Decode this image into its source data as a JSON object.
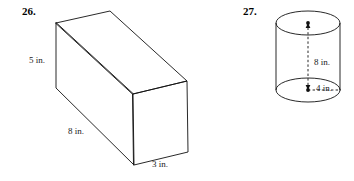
{
  "page": {
    "background_color": "#ffffff",
    "ink_color": "#000000",
    "width": 354,
    "height": 181
  },
  "problems": [
    {
      "number": "26.",
      "shape": "rectangular-prism",
      "labels": [
        {
          "name": "height",
          "text": "5 in.",
          "value": 5,
          "unit": "in."
        },
        {
          "name": "length",
          "text": "8 in.",
          "value": 8,
          "unit": "in."
        },
        {
          "name": "depth",
          "text": "3  in.",
          "value": 3,
          "unit": "in."
        }
      ]
    },
    {
      "number": "27.",
      "shape": "cylinder",
      "labels": [
        {
          "name": "height",
          "text": "8 in.",
          "value": 8,
          "unit": "in."
        },
        {
          "name": "radius",
          "text": "4 in.",
          "value": 4,
          "unit": "in."
        }
      ]
    }
  ],
  "geometry": {
    "prism": {
      "front_top_left": [
        56,
        23
      ],
      "front_bottom_left": [
        56,
        88
      ],
      "top_back_left": [
        110,
        11
      ],
      "top_back_right": [
        187,
        81
      ],
      "front_top_right": [
        133,
        94
      ],
      "front_bottom_right": [
        134,
        165
      ],
      "right_bottom": [
        188,
        152
      ],
      "right_top": [
        187,
        81
      ]
    },
    "cylinder": {
      "top_center": [
        308,
        23
      ],
      "bottom_center": [
        308,
        90
      ],
      "radius_x": 32,
      "radius_y": 12,
      "body_top_y": 23,
      "body_bottom_y": 90,
      "radius_tick_end_x": 341
    }
  }
}
